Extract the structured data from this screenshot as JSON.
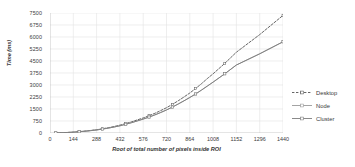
{
  "chart_data": {
    "type": "line",
    "title": "",
    "xlabel": "Root of total number of pixels inside ROI",
    "ylabel": "Time (ms)",
    "xlim": [
      0,
      1440
    ],
    "ylim": [
      0,
      7500
    ],
    "grid": true,
    "legend_position": "right",
    "x_ticks": [
      0,
      144,
      288,
      432,
      576,
      720,
      864,
      1008,
      1152,
      1296,
      1440
    ],
    "y_ticks": [
      0,
      750,
      1500,
      2250,
      3000,
      3750,
      4500,
      5250,
      6000,
      6750,
      7500
    ],
    "x": [
      36,
      72,
      108,
      144,
      180,
      216,
      252,
      288,
      324,
      360,
      396,
      432,
      468,
      504,
      540,
      576,
      612,
      648,
      684,
      720,
      756,
      792,
      828,
      864,
      900,
      936,
      972,
      1008,
      1080,
      1152,
      1296,
      1440
    ],
    "series": [
      {
        "name": "Desktop",
        "style": "dashed",
        "color": "#555555",
        "values": [
          8,
          20,
          35,
          55,
          85,
          120,
          160,
          205,
          265,
          330,
          405,
          490,
          590,
          700,
          820,
          940,
          1080,
          1230,
          1400,
          1580,
          1790,
          2010,
          2250,
          2500,
          2780,
          3080,
          3400,
          3700,
          4350,
          5050,
          6150,
          7350
        ]
      },
      {
        "name": "Node",
        "style": "solid-marker",
        "color": "#9a9a9a",
        "values": [
          8,
          18,
          32,
          50,
          78,
          110,
          148,
          190,
          245,
          305,
          375,
          450,
          545,
          645,
          755,
          870,
          995,
          1130,
          1280,
          1440,
          1620,
          1810,
          2010,
          2220,
          2440,
          2680,
          2930,
          3180,
          3700,
          4250,
          4950,
          5700
        ]
      },
      {
        "name": "Cluster",
        "style": "solid",
        "color": "#7d7d7d",
        "values": [
          8,
          18,
          32,
          50,
          78,
          110,
          148,
          190,
          245,
          305,
          375,
          450,
          545,
          645,
          755,
          870,
          995,
          1130,
          1280,
          1440,
          1620,
          1810,
          2010,
          2220,
          2440,
          2680,
          2930,
          3180,
          3700,
          4250,
          4950,
          5700
        ]
      }
    ]
  },
  "legend": {
    "items": [
      {
        "label": "Desktop"
      },
      {
        "label": "Node"
      },
      {
        "label": "Cluster"
      }
    ]
  },
  "colors": {
    "grid": "#e2e2e2",
    "axis": "#bdbdbd",
    "text": "#3a3a3a",
    "desktop": "#555555",
    "node": "#9a9a9a",
    "cluster": "#7d7d7d"
  }
}
